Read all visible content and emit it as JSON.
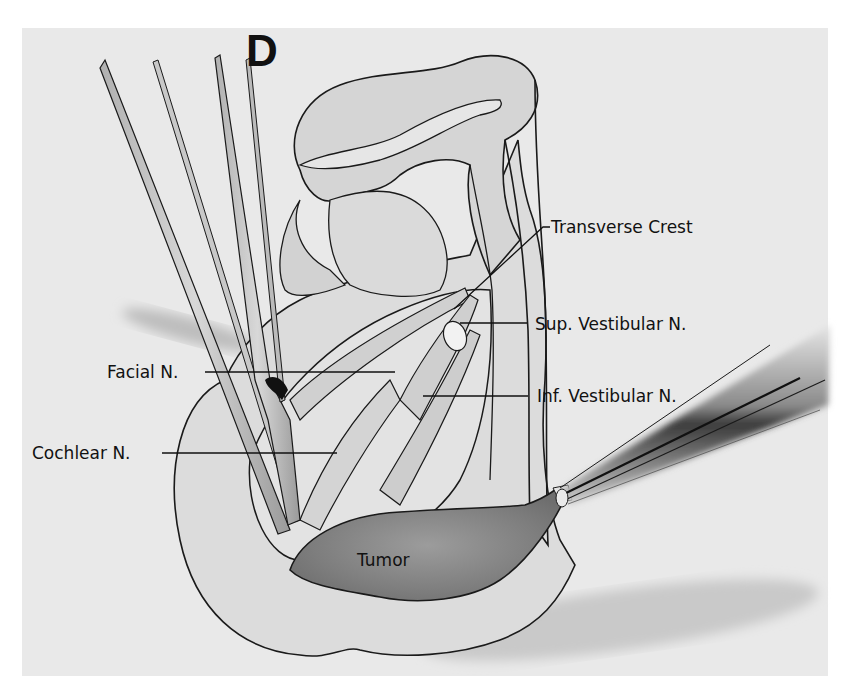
{
  "figure": {
    "panel_letter": "D",
    "labels": {
      "transverse_crest": "Transverse Crest",
      "sup_vestibular": "Sup. Vestibular N.",
      "facial": "Facial  N.",
      "inf_vestibular": "Inf. Vestibular  N.",
      "cochlear": "Cochlear N.",
      "tumor": "Tumor"
    },
    "colors": {
      "paper": "#e9e9e9",
      "tissue": "#d8d8d8",
      "tissue_light": "#e2e2e2",
      "tumor": "#8f8f8f",
      "outline": "#1a1a1a",
      "shadow": "#b5b5b5"
    }
  }
}
